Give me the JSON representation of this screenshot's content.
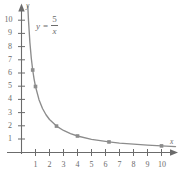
{
  "chart_data": {
    "type": "line",
    "title": "",
    "equation_label": {
      "lhs": "y",
      "operator": "=",
      "numerator": "5",
      "denominator": "x"
    },
    "xlabel": "x",
    "ylabel": "y",
    "xlim": [
      0,
      11.2
    ],
    "ylim": [
      0,
      11.2
    ],
    "xticks": [
      1,
      2,
      3,
      4,
      5,
      6,
      7,
      8,
      9,
      10
    ],
    "yticks": [
      1,
      2,
      3,
      4,
      5,
      6,
      7,
      8,
      9,
      10
    ],
    "xtick_labels": [
      "1",
      "2",
      "3",
      "4",
      "5",
      "6",
      "7",
      "8",
      "9",
      "10"
    ],
    "ytick_labels": [
      "1",
      "2",
      "3",
      "4",
      "5",
      "6",
      "7",
      "8",
      "9",
      "10"
    ],
    "grid": false,
    "legend": "none",
    "axis_arrows": [
      "x-positive",
      "y-positive"
    ],
    "curve_color": "#8c8c8c",
    "axis_color": "#6b6b6b",
    "marker_color": "#8c8c8c",
    "marker_shape": "square",
    "series": [
      {
        "name": "y = 5/x",
        "x": [
          0.45,
          0.5,
          0.6,
          0.7,
          0.8,
          0.9,
          1.0,
          1.25,
          1.5,
          1.75,
          2.0,
          2.5,
          3.0,
          3.5,
          4.0,
          5.0,
          6.25,
          7.0,
          8.0,
          9.0,
          10.0,
          11.0
        ],
        "y": [
          11.11,
          10.0,
          8.33,
          7.14,
          6.25,
          5.56,
          5.0,
          4.0,
          3.33,
          2.86,
          2.5,
          2.0,
          1.67,
          1.43,
          1.25,
          1.0,
          0.8,
          0.71,
          0.63,
          0.56,
          0.5,
          0.45
        ]
      }
    ],
    "marked_points": [
      {
        "x": 0.8,
        "y": 6.25
      },
      {
        "x": 1.0,
        "y": 5.0
      },
      {
        "x": 2.5,
        "y": 2.0
      },
      {
        "x": 4.0,
        "y": 1.25
      },
      {
        "x": 6.25,
        "y": 0.8
      },
      {
        "x": 10.0,
        "y": 0.5
      }
    ]
  }
}
